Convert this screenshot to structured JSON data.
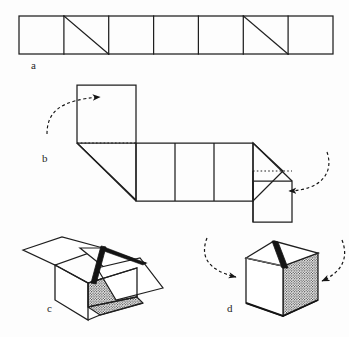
{
  "figure": {
    "background_color": "#fdfdfd",
    "ink_color": "#1a1a1a",
    "panels": [
      {
        "id": "a",
        "label": "a",
        "caption": "Flat strip of seven square cells with two diagonal creases"
      },
      {
        "id": "b",
        "label": "b",
        "caption": "Strip partially folded into a Z shape with two curved fold arrows"
      },
      {
        "id": "c",
        "label": "c",
        "caption": "Open box with flaps spread and one shaded interior face"
      },
      {
        "id": "d",
        "label": "d",
        "caption": "Closed cube with two curved arrows pressing the flaps shut"
      }
    ]
  },
  "panel_a": {
    "label": "a",
    "cell_count": 7,
    "diagonal_cells": [
      2,
      6
    ],
    "x_start": 19,
    "x_end": 333,
    "y_top": 16,
    "y_bottom": 54,
    "cell_width": 44.86
  },
  "panel_b": {
    "label": "b",
    "arrows": [
      {
        "name": "left-fold-arrow",
        "style": "dashed-curve",
        "direction": "right",
        "head_x": 104,
        "head_y": 99
      },
      {
        "name": "right-fold-arrow",
        "style": "dashed-curve",
        "direction": "left",
        "head_x": 283,
        "head_y": 187
      }
    ],
    "middle_cell_count": 3
  },
  "panel_c": {
    "label": "c",
    "shading": "stipple",
    "flap_count": 3
  },
  "panel_d": {
    "label": "d",
    "shading": "stipple",
    "arrows": [
      {
        "name": "left-close-arrow",
        "style": "dashed-curve",
        "direction": "down-right"
      },
      {
        "name": "right-close-arrow",
        "style": "dashed-curve",
        "direction": "down-left"
      }
    ]
  }
}
